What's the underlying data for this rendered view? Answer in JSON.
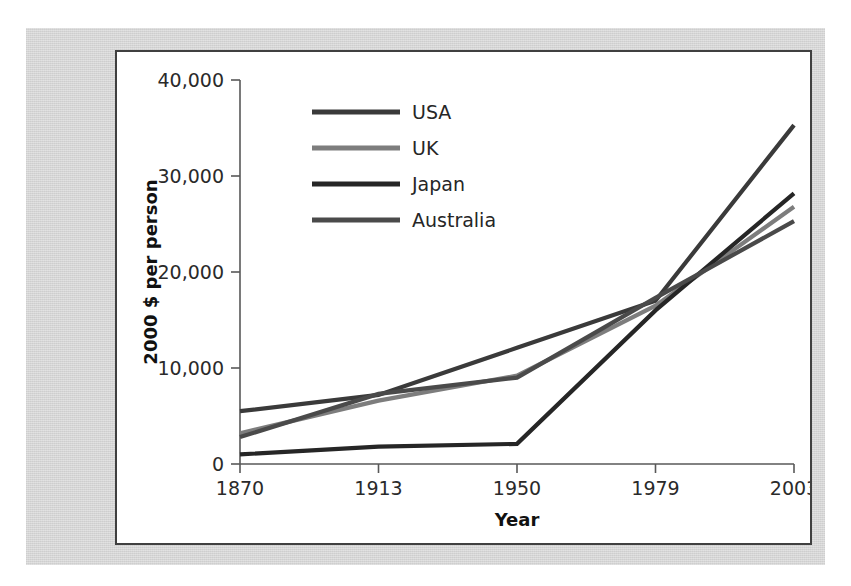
{
  "figure": {
    "background_color": "#d5d5d5",
    "card_background": "#ffffff",
    "card_border_color": "#404040"
  },
  "ghost_text": [
    {
      "y": 196,
      "x": 150,
      "text": "of the world. For much of human history, material living standards"
    },
    {
      "y": 238,
      "x": 150,
      "text": "changed little from one generation to the next, but that changed"
    },
    {
      "y": 352,
      "x": 60,
      "text": "by the rapid growth of output per person. The figure below shows"
    },
    {
      "y": 372,
      "x": 60,
      "text": "estimates of real income per head for four countries over the"
    },
    {
      "y": 392,
      "x": 60,
      "text": "period 1870 to 2003, measured in constant 2000 US dollars, so"
    },
    {
      "y": 412,
      "x": 60,
      "text": "that the numbers can be compared directly across both time and"
    },
    {
      "y": 432,
      "x": 60,
      "text": "place. Japan began the period far poorer than the others and grew"
    },
    {
      "y": 452,
      "x": 60,
      "text": "dramatically after 1950, catching up with the western economies."
    }
  ],
  "chart_data": {
    "type": "line",
    "title": "",
    "xlabel": "Year",
    "ylabel": "2000 $ per person",
    "x": [
      1870,
      1913,
      1950,
      1979,
      2003
    ],
    "x_tick_labels": [
      "1870",
      "1913",
      "1950",
      "1979",
      "2003"
    ],
    "y_ticks": [
      0,
      10000,
      20000,
      30000,
      40000
    ],
    "y_tick_labels": [
      "0",
      "10,000",
      "20,000",
      "30,000",
      "40,000"
    ],
    "ylim": [
      0,
      40000
    ],
    "grid": false,
    "legend_position": "upper-center-left",
    "series": [
      {
        "name": "USA",
        "color": "#3a3a3a",
        "values": [
          5500,
          7200,
          12100,
          17000,
          35300
        ]
      },
      {
        "name": "UK",
        "color": "#7d7d7d",
        "values": [
          3200,
          6600,
          9200,
          16500,
          26800
        ]
      },
      {
        "name": "Japan",
        "color": "#262626",
        "values": [
          1000,
          1800,
          2100,
          16000,
          28200
        ]
      },
      {
        "name": "Australia",
        "color": "#4a4a4a",
        "values": [
          2800,
          7300,
          9000,
          17300,
          25300
        ]
      }
    ]
  },
  "legend": {
    "entries": [
      {
        "label": "USA",
        "color": "#3a3a3a"
      },
      {
        "label": "UK",
        "color": "#7d7d7d"
      },
      {
        "label": "Japan",
        "color": "#262626"
      },
      {
        "label": "Australia",
        "color": "#4a4a4a"
      }
    ]
  }
}
